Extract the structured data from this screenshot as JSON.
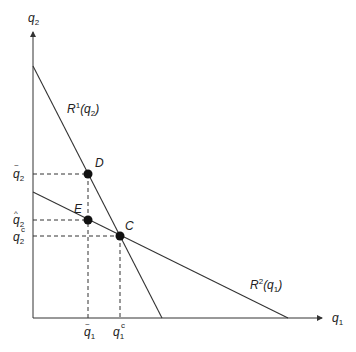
{
  "diagram": {
    "type": "reaction-functions",
    "axes": {
      "x_label": "q",
      "x_label_sub": "1",
      "y_label": "q",
      "y_label_sub": "2"
    },
    "curves": [
      {
        "id": "R1",
        "label_main": "R",
        "label_sup": "1",
        "label_arg": "(q",
        "label_arg_sub": "2",
        "label_close": ")"
      },
      {
        "id": "R2",
        "label_main": "R",
        "label_sup": "2",
        "label_arg": "(q",
        "label_arg_sub": "1",
        "label_close": ")"
      }
    ],
    "points": [
      {
        "id": "D",
        "label": "D"
      },
      {
        "id": "E",
        "label": "E"
      },
      {
        "id": "C",
        "label": "C"
      }
    ],
    "y_ticks": [
      {
        "id": "q2-tilde",
        "base": "q",
        "accent": "~",
        "sub": "2"
      },
      {
        "id": "q2-hat",
        "base": "q",
        "accent": "^",
        "sub": "2"
      },
      {
        "id": "q2-c",
        "base": "q",
        "sup": "c",
        "sub": "2"
      }
    ],
    "x_ticks": [
      {
        "id": "q1-tilde",
        "base": "q",
        "accent": "~",
        "sub": "1"
      },
      {
        "id": "q1-c",
        "base": "q",
        "sup": "c",
        "sub": "1"
      }
    ],
    "colors": {
      "line": "#333333",
      "point": "#111111",
      "background": "#ffffff"
    }
  }
}
